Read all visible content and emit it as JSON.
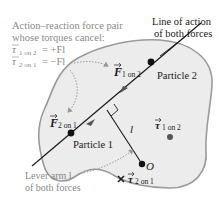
{
  "annotations": {
    "torque_pair": {
      "line1": "Action–reaction force pair",
      "line2": "whose torques cancel:",
      "eq1_sym": "τ",
      "eq1_sub": "1 on 2",
      "eq1_rhs": "= +Fl",
      "eq2_sym": "τ",
      "eq2_sub": "2 on 1",
      "eq2_rhs": "= −Fl"
    },
    "line_of_action": {
      "line1": "Line of action",
      "line2": "of both forces"
    },
    "lever_arm": {
      "line1": "Lever arm l",
      "line2": "of both forces"
    }
  },
  "labels": {
    "force_1_on_2": {
      "symbol": "F",
      "sub": "1 on 2"
    },
    "force_2_on_1": {
      "symbol": "F",
      "sub": "2 on 1"
    },
    "particle_1": "Particle 1",
    "particle_2": "Particle 2",
    "lever_arm_symbol": "l",
    "origin": "O",
    "torque_1_on_2": {
      "symbol": "τ",
      "sub": "1 on 2"
    },
    "torque_2_on_1": {
      "symbol": "τ",
      "sub": "2 on 1"
    }
  },
  "colors": {
    "body_fill": "#ececec",
    "body_stroke": "#9a9a9a",
    "line": "#1a1a1a",
    "annotation_text": "#8a8a8a",
    "dotted": "#9a9a9a"
  }
}
